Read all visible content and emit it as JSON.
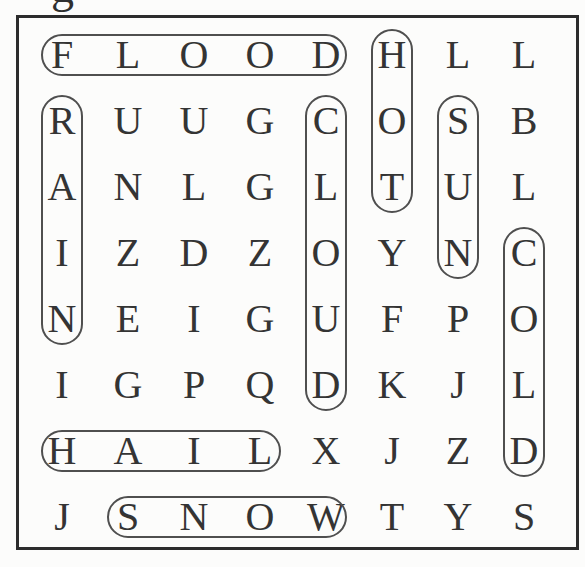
{
  "page": {
    "background": "#fcfcfb",
    "cropped_title_fragment": "g"
  },
  "puzzle": {
    "rows": 8,
    "cols": 8,
    "grid": [
      [
        "F",
        "L",
        "O",
        "O",
        "D",
        "H",
        "L",
        "L"
      ],
      [
        "R",
        "U",
        "U",
        "G",
        "C",
        "O",
        "S",
        "B"
      ],
      [
        "A",
        "N",
        "L",
        "G",
        "L",
        "T",
        "U",
        "L"
      ],
      [
        "I",
        "Z",
        "D",
        "Z",
        "O",
        "Y",
        "N",
        "C"
      ],
      [
        "N",
        "E",
        "I",
        "G",
        "U",
        "F",
        "P",
        "O"
      ],
      [
        "I",
        "G",
        "P",
        "Q",
        "D",
        "K",
        "J",
        "L"
      ],
      [
        "H",
        "A",
        "I",
        "L",
        "X",
        "J",
        "Z",
        "D"
      ],
      [
        "J",
        "S",
        "N",
        "O",
        "W",
        "T",
        "Y",
        "S"
      ]
    ],
    "found_words": [
      {
        "word": "FLOOD",
        "direction": "horizontal",
        "row": 1,
        "start_col": 1,
        "end_col": 5
      },
      {
        "word": "HOT",
        "direction": "vertical",
        "col": 6,
        "start_row": 1,
        "end_row": 3
      },
      {
        "word": "RAIN",
        "direction": "vertical",
        "col": 1,
        "start_row": 2,
        "end_row": 5
      },
      {
        "word": "CLOUD",
        "direction": "vertical",
        "col": 5,
        "start_row": 2,
        "end_row": 6
      },
      {
        "word": "SUN",
        "direction": "vertical",
        "col": 7,
        "start_row": 2,
        "end_row": 4
      },
      {
        "word": "COLD",
        "direction": "vertical",
        "col": 8,
        "start_row": 4,
        "end_row": 7
      },
      {
        "word": "HAIL",
        "direction": "horizontal",
        "row": 7,
        "start_col": 1,
        "end_col": 4
      },
      {
        "word": "SNOW",
        "direction": "horizontal",
        "row": 8,
        "start_col": 2,
        "end_col": 5
      }
    ],
    "colors": {
      "letter": "#343434",
      "oval_stroke": "#4f4f4f",
      "box_border": "#2c2c2c"
    }
  }
}
